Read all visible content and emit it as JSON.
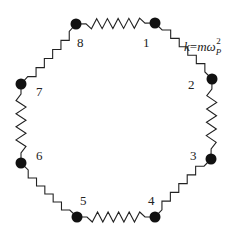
{
  "diagram": {
    "spring_constant_label": {
      "k": "k",
      "eq": "=",
      "m": "m",
      "omega": "ω",
      "subscript": "P",
      "superscript": "2"
    },
    "masses": [
      {
        "id": "1",
        "label": "1"
      },
      {
        "id": "2",
        "label": "2"
      },
      {
        "id": "3",
        "label": "3"
      },
      {
        "id": "4",
        "label": "4"
      },
      {
        "id": "5",
        "label": "5"
      },
      {
        "id": "6",
        "label": "6"
      },
      {
        "id": "7",
        "label": "7"
      },
      {
        "id": "8",
        "label": "8"
      }
    ],
    "springs": [
      {
        "from": "1",
        "to": "2"
      },
      {
        "from": "2",
        "to": "3"
      },
      {
        "from": "3",
        "to": "4"
      },
      {
        "from": "4",
        "to": "5"
      },
      {
        "from": "5",
        "to": "6"
      },
      {
        "from": "6",
        "to": "7"
      },
      {
        "from": "7",
        "to": "8"
      },
      {
        "from": "8",
        "to": "1"
      }
    ],
    "colors": {
      "ink": "#111111",
      "background": "#ffffff"
    }
  }
}
